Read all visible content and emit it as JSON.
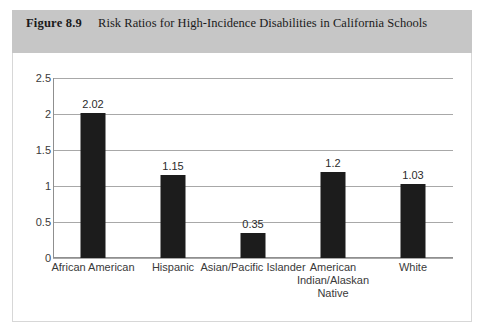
{
  "figure": {
    "number": "Figure 8.9",
    "title": "Risk Ratios for High-Incidence Disabilities in California Schools"
  },
  "chart_data": {
    "type": "bar",
    "title": "Risk Ratios for High-Incidence Disabilities in California Schools",
    "categories": [
      "African American",
      "Hispanic",
      "Asian/Pacific Islander",
      "American Indian/Alaskan Native",
      "White"
    ],
    "values": [
      2.02,
      1.15,
      0.35,
      1.2,
      1.03
    ],
    "value_labels": [
      "2.02",
      "1.15",
      "0.35",
      "1.2",
      "1.03"
    ],
    "xlabel": "",
    "ylabel": "",
    "ylim": [
      0,
      2.5
    ],
    "yticks": [
      0,
      0.5,
      1,
      1.5,
      2,
      2.5
    ],
    "ytick_labels": [
      "0",
      "0.5",
      "1",
      "1.5",
      "2",
      "2.5"
    ],
    "grid": true,
    "legend": false,
    "bar_color": "#1c1c1c",
    "gridline_color": "#a8a8a8",
    "header_color": "#c6c6c6"
  }
}
